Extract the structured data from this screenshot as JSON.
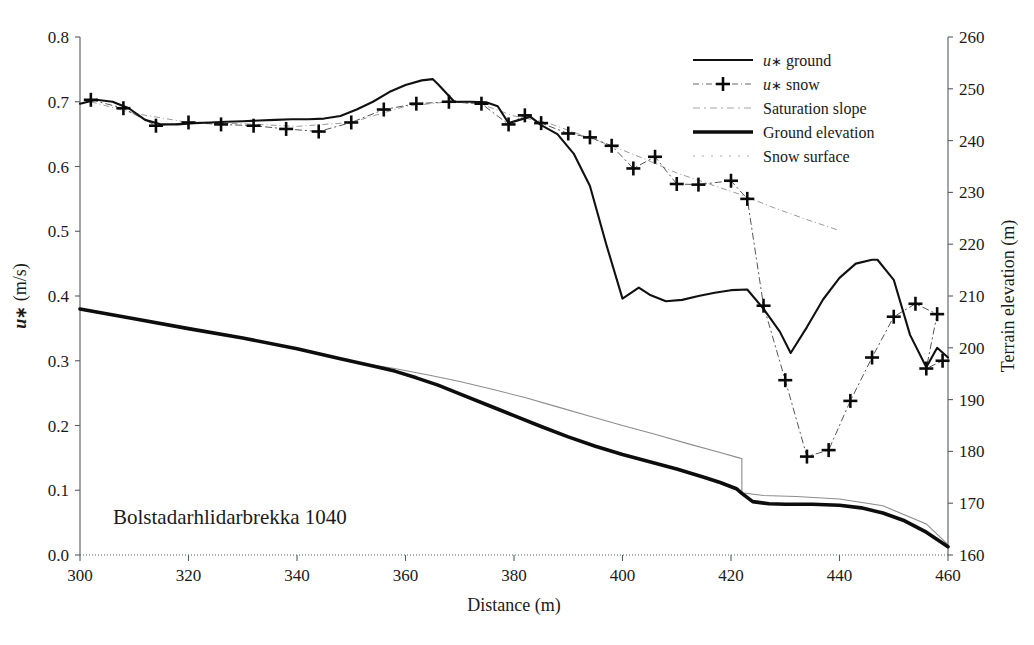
{
  "figure": {
    "annotation": "Bolstadarhlidarbrekka 1040",
    "background": "#ffffff",
    "axis_color": "#555c63"
  },
  "legend": {
    "position": "top-right",
    "entries": [
      {
        "label_prefix": "u",
        "label_symbol": "∗",
        "label": " ground",
        "full": "u∗ ground",
        "style": "solid-thin",
        "color": "#111111",
        "name": "ustar-ground"
      },
      {
        "label_prefix": "u",
        "label_symbol": "∗",
        "label": " snow",
        "full": "u∗ snow",
        "style": "dashdot-plus",
        "color": "#555555",
        "name": "ustar-snow"
      },
      {
        "label_prefix": "",
        "label_symbol": "",
        "label": "Saturation slope",
        "full": "Saturation slope",
        "style": "dashdot-faint",
        "color": "#999999",
        "name": "saturation-slope"
      },
      {
        "label_prefix": "",
        "label_symbol": "",
        "label": "Ground elevation",
        "full": "Ground elevation",
        "style": "solid-thick",
        "color": "#0d0d0d",
        "name": "ground-elevation"
      },
      {
        "label_prefix": "",
        "label_symbol": "",
        "label": "Snow surface",
        "full": "Snow surface",
        "style": "dotted-faint",
        "color": "#8c8c8c",
        "name": "snow-surface"
      }
    ]
  },
  "chart_data": {
    "type": "line",
    "title": "",
    "subtitle": "",
    "annotation": "Bolstadarhlidarbrekka 1040",
    "xlabel": "Distance (m)",
    "ylabel": "u∗ (m/s)",
    "y2label": "Terrain elevation (m)",
    "xlim": [
      300,
      460
    ],
    "ylim": [
      0.0,
      0.8
    ],
    "y2lim": [
      160,
      260
    ],
    "xticks": [
      300,
      320,
      340,
      360,
      380,
      400,
      420,
      440,
      460
    ],
    "yticks": [
      "0.0",
      "0.1",
      "0.2",
      "0.3",
      "0.4",
      "0.5",
      "0.6",
      "0.7",
      "0.8"
    ],
    "y2ticks": [
      160,
      170,
      180,
      190,
      200,
      210,
      220,
      230,
      240,
      250,
      260
    ],
    "grid": false,
    "legend_position": "top-right",
    "series": [
      {
        "name": "u∗ ground",
        "axis": "left",
        "style": "solid-thin",
        "x": [
          300,
          303,
          306,
          309,
          312,
          315,
          318,
          321,
          324,
          327,
          330,
          333,
          336,
          339,
          342,
          345,
          348,
          351,
          354,
          357,
          360,
          363,
          365,
          366,
          369,
          372,
          375,
          377,
          379,
          381,
          383,
          385,
          388,
          391,
          394,
          397,
          400,
          403,
          405,
          408,
          411,
          414,
          417,
          420,
          423,
          426,
          429,
          431,
          434,
          437,
          440,
          443,
          446,
          447,
          450,
          453,
          456,
          458,
          460
        ],
        "y": [
          0.697,
          0.703,
          0.7,
          0.69,
          0.672,
          0.665,
          0.665,
          0.667,
          0.668,
          0.669,
          0.67,
          0.671,
          0.672,
          0.673,
          0.673,
          0.674,
          0.678,
          0.688,
          0.7,
          0.715,
          0.726,
          0.733,
          0.735,
          0.727,
          0.7,
          0.7,
          0.699,
          0.693,
          0.667,
          0.672,
          0.677,
          0.664,
          0.65,
          0.62,
          0.57,
          0.48,
          0.396,
          0.413,
          0.402,
          0.392,
          0.394,
          0.4,
          0.405,
          0.409,
          0.41,
          0.38,
          0.345,
          0.312,
          0.352,
          0.395,
          0.428,
          0.45,
          0.456,
          0.456,
          0.425,
          0.34,
          0.29,
          0.32,
          0.305
        ]
      },
      {
        "name": "u∗ snow",
        "axis": "left",
        "style": "dashdot-plus",
        "marker": "plus",
        "x": [
          302,
          308,
          314,
          320,
          326,
          332,
          338,
          344,
          350,
          356,
          362,
          368,
          374,
          379,
          382,
          385,
          390,
          394,
          398,
          402,
          406,
          410,
          414,
          420,
          423,
          426,
          430,
          434,
          438,
          442,
          446,
          450,
          454,
          458
        ],
        "y": [
          0.703,
          0.69,
          0.663,
          0.668,
          0.665,
          0.663,
          0.658,
          0.654,
          0.668,
          0.688,
          0.697,
          0.7,
          0.697,
          0.665,
          0.679,
          0.667,
          0.651,
          0.645,
          0.632,
          0.597,
          0.615,
          0.573,
          0.572,
          0.578,
          0.55,
          0.385,
          0.27,
          0.152,
          0.162,
          0.238,
          0.305,
          0.368,
          0.388,
          0.372
        ],
        "x_extra": [
          456,
          459
        ],
        "y_extra": [
          0.288,
          0.3
        ]
      },
      {
        "name": "Ground elevation",
        "axis": "right",
        "style": "solid-thick",
        "x": [
          300,
          310,
          320,
          330,
          340,
          348,
          354,
          358,
          362,
          366,
          370,
          375,
          380,
          385,
          390,
          395,
          400,
          405,
          410,
          415,
          418,
          421,
          422,
          424,
          427,
          430,
          435,
          440,
          444,
          448,
          452,
          456,
          460
        ],
        "y_left_scale": [
          0.38,
          0.365,
          0.35,
          0.335,
          0.318,
          0.303,
          0.292,
          0.284,
          0.274,
          0.262,
          0.249,
          0.232,
          0.215,
          0.198,
          0.182,
          0.168,
          0.155,
          0.144,
          0.133,
          0.12,
          0.112,
          0.102,
          0.095,
          0.082,
          0.079,
          0.078,
          0.078,
          0.077,
          0.073,
          0.065,
          0.053,
          0.035,
          0.013
        ],
        "y": [
          207.5,
          205.6,
          203.7,
          201.9,
          199.8,
          197.9,
          196.5,
          195.5,
          194.2,
          192.8,
          191.1,
          189.0,
          186.9,
          184.8,
          182.8,
          181.0,
          179.4,
          178.0,
          176.6,
          175.0,
          174.0,
          172.8,
          171.9,
          170.3,
          169.9,
          169.8,
          169.8,
          169.6,
          169.1,
          168.1,
          166.6,
          164.4,
          161.6
        ]
      },
      {
        "name": "Snow surface",
        "axis": "right",
        "style": "dotted-faint",
        "x": [
          352,
          358,
          364,
          370,
          376,
          382,
          388,
          394,
          400,
          406,
          412,
          418,
          421,
          422,
          422,
          426,
          432,
          440,
          448,
          456,
          460
        ],
        "y_left_scale": [
          0.296,
          0.288,
          0.278,
          0.268,
          0.256,
          0.243,
          0.229,
          0.214,
          0.2,
          0.186,
          0.172,
          0.158,
          0.151,
          0.149,
          0.096,
          0.092,
          0.09,
          0.086,
          0.076,
          0.048,
          0.016
        ],
        "y": [
          197.0,
          196.0,
          194.8,
          193.5,
          192.0,
          190.4,
          188.6,
          186.8,
          185.0,
          183.3,
          181.5,
          179.8,
          178.9,
          178.6,
          172.0,
          171.5,
          171.3,
          170.8,
          169.5,
          166.0,
          162.0
        ]
      },
      {
        "name": "Saturation slope",
        "axis": "left",
        "style": "dashdot-faint",
        "x": [
          302,
          310,
          320,
          330,
          340,
          350,
          360,
          368,
          374,
          380,
          386,
          392,
          398,
          404,
          410,
          416,
          422,
          428,
          434,
          440
        ],
        "y": [
          0.7,
          0.682,
          0.668,
          0.666,
          0.662,
          0.668,
          0.693,
          0.7,
          0.696,
          0.678,
          0.668,
          0.65,
          0.632,
          0.612,
          0.59,
          0.573,
          0.556,
          0.536,
          0.518,
          0.501
        ]
      }
    ]
  }
}
